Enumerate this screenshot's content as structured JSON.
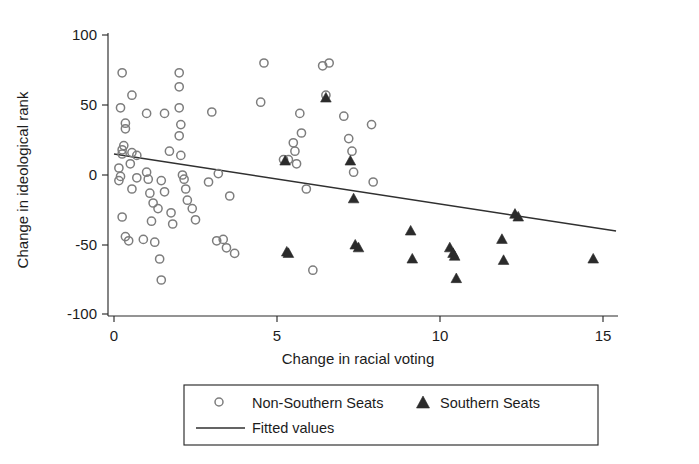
{
  "chart_data": {
    "type": "scatter",
    "title": "",
    "xlabel": "Change in racial voting",
    "ylabel": "Change in ideological rank",
    "xlim": [
      -0.35,
      15.6
    ],
    "ylim": [
      -105,
      105
    ],
    "xticks": [
      0,
      5,
      10,
      15
    ],
    "xtick_labels": [
      "0",
      "5",
      "10",
      "15"
    ],
    "yticks": [
      -100,
      -50,
      0,
      50,
      100
    ],
    "ytick_labels": [
      "-100",
      "-50",
      "0",
      "50",
      "100"
    ],
    "grid": false,
    "legend_position": "below-center",
    "series": [
      {
        "name": "Non-Southern Seats",
        "marker": "open-circle",
        "color": "#7d7d7d",
        "points": [
          [
            0.25,
            73
          ],
          [
            0.55,
            57
          ],
          [
            0.2,
            48
          ],
          [
            0.35,
            37
          ],
          [
            0.35,
            33
          ],
          [
            0.3,
            21
          ],
          [
            0.25,
            18
          ],
          [
            0.25,
            15
          ],
          [
            0.55,
            16
          ],
          [
            0.7,
            14
          ],
          [
            0.15,
            5
          ],
          [
            0.2,
            -1
          ],
          [
            0.15,
            -4
          ],
          [
            0.5,
            8
          ],
          [
            0.7,
            -2
          ],
          [
            0.55,
            -10
          ],
          [
            0.25,
            -30
          ],
          [
            0.35,
            -44
          ],
          [
            0.45,
            -47
          ],
          [
            0.9,
            -46
          ],
          [
            1.15,
            -33
          ],
          [
            1.25,
            -48
          ],
          [
            1.0,
            44
          ],
          [
            1.0,
            2
          ],
          [
            1.05,
            -3
          ],
          [
            1.1,
            -13
          ],
          [
            1.2,
            -20
          ],
          [
            1.35,
            -24
          ],
          [
            1.4,
            -60
          ],
          [
            1.45,
            -75
          ],
          [
            1.45,
            -4
          ],
          [
            1.55,
            44
          ],
          [
            1.55,
            -12
          ],
          [
            1.7,
            17
          ],
          [
            1.75,
            -27
          ],
          [
            1.8,
            -35
          ],
          [
            2.0,
            73
          ],
          [
            2.0,
            63
          ],
          [
            2.0,
            48
          ],
          [
            2.05,
            36
          ],
          [
            2.0,
            28
          ],
          [
            2.05,
            14
          ],
          [
            2.1,
            0
          ],
          [
            2.15,
            -3
          ],
          [
            2.2,
            -10
          ],
          [
            2.25,
            -18
          ],
          [
            2.4,
            -24
          ],
          [
            2.5,
            -32
          ],
          [
            2.9,
            -5
          ],
          [
            3.0,
            45
          ],
          [
            3.15,
            -47
          ],
          [
            3.35,
            -46
          ],
          [
            3.45,
            -52
          ],
          [
            3.2,
            1
          ],
          [
            3.55,
            -15
          ],
          [
            3.7,
            -56
          ],
          [
            4.5,
            52
          ],
          [
            4.6,
            80
          ],
          [
            5.2,
            11
          ],
          [
            5.35,
            11
          ],
          [
            5.5,
            23
          ],
          [
            5.55,
            17
          ],
          [
            5.6,
            8
          ],
          [
            5.7,
            44
          ],
          [
            5.75,
            30
          ],
          [
            5.9,
            -10
          ],
          [
            6.1,
            -68
          ],
          [
            6.4,
            78
          ],
          [
            6.5,
            57
          ],
          [
            6.6,
            80
          ],
          [
            7.05,
            42
          ],
          [
            7.2,
            26
          ],
          [
            7.3,
            17
          ],
          [
            7.35,
            2
          ],
          [
            7.9,
            36
          ],
          [
            7.95,
            -5
          ]
        ]
      },
      {
        "name": "Southern Seats",
        "marker": "filled-triangle",
        "color": "#2b2b2b",
        "points": [
          [
            5.25,
            10
          ],
          [
            5.3,
            -55
          ],
          [
            5.35,
            -56
          ],
          [
            6.5,
            55
          ],
          [
            7.25,
            10
          ],
          [
            7.35,
            -17
          ],
          [
            7.4,
            -50
          ],
          [
            7.5,
            -52
          ],
          [
            9.1,
            -40
          ],
          [
            9.15,
            -60
          ],
          [
            10.3,
            -52
          ],
          [
            10.4,
            -56
          ],
          [
            10.45,
            -58
          ],
          [
            10.5,
            -74
          ],
          [
            11.9,
            -46
          ],
          [
            11.95,
            -61
          ],
          [
            12.3,
            -28
          ],
          [
            12.4,
            -30
          ],
          [
            14.7,
            -60
          ]
        ]
      }
    ],
    "fitted_line": {
      "name": "Fitted values",
      "x_start": 0,
      "y_start": 15,
      "x_end": 15.4,
      "y_end": -40,
      "color": "#303030"
    }
  },
  "legend": {
    "entries": [
      {
        "label": "Non-Southern Seats",
        "marker": "open-circle"
      },
      {
        "label": "Southern Seats",
        "marker": "filled-triangle"
      },
      {
        "label": "Fitted values",
        "marker": "line"
      }
    ]
  }
}
